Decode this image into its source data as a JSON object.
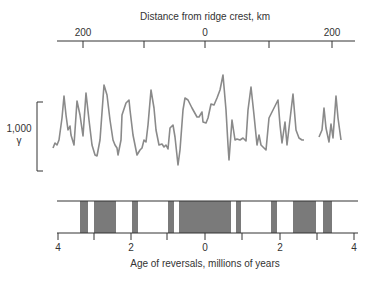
{
  "top_axis": {
    "title": "Distance from ridge crest, km",
    "tick_labels": [
      {
        "label": "200",
        "x": 83
      },
      {
        "label": "0",
        "x": 205
      },
      {
        "label": "200",
        "x": 332
      }
    ],
    "tick_positions": [
      83,
      144,
      205,
      269,
      332
    ]
  },
  "scale": {
    "value": "1,000",
    "unit": "γ"
  },
  "bottom_axis": {
    "title": "Age of reversals, millions of years",
    "tick_labels": [
      {
        "label": "4",
        "x": 58
      },
      {
        "label": "2",
        "x": 131
      },
      {
        "label": "0",
        "x": 205
      },
      {
        "label": "2",
        "x": 280
      },
      {
        "label": "4",
        "x": 354
      }
    ],
    "tick_positions": [
      58,
      94,
      131,
      167,
      205,
      242,
      280,
      317,
      354
    ]
  },
  "colors": {
    "profile": "#8a8a8a",
    "band": "#7a7a7a",
    "axis": "#333333"
  },
  "chart_data": {
    "type": "line",
    "xlabel_top": "Distance from ridge crest, km",
    "xlabel_bottom": "Age of reversals, millions of years",
    "scale_bar": "1,000 γ",
    "profile_segments": [
      [
        [
          53,
          148
        ],
        [
          55,
          143
        ],
        [
          57,
          145
        ],
        [
          59,
          140
        ],
        [
          62,
          118
        ],
        [
          64,
          96
        ],
        [
          66,
          115
        ],
        [
          68,
          130
        ],
        [
          70,
          126
        ],
        [
          71,
          135
        ],
        [
          74,
          145
        ],
        [
          77,
          101
        ],
        [
          80,
          115
        ],
        [
          83,
          136
        ],
        [
          86,
          93
        ],
        [
          89,
          120
        ],
        [
          92,
          145
        ],
        [
          95,
          155
        ],
        [
          97,
          156
        ],
        [
          100,
          140
        ],
        [
          104,
          85
        ],
        [
          107,
          95
        ],
        [
          110,
          120
        ],
        [
          113,
          140
        ],
        [
          115,
          145
        ],
        [
          117,
          148
        ],
        [
          118,
          155
        ],
        [
          121,
          140
        ],
        [
          122,
          115
        ],
        [
          126,
          103
        ],
        [
          129,
          100
        ],
        [
          130,
          110
        ],
        [
          133,
          135
        ],
        [
          137,
          155
        ],
        [
          140,
          150
        ],
        [
          142,
          148
        ],
        [
          144,
          140
        ],
        [
          146,
          142
        ],
        [
          148,
          125
        ],
        [
          151,
          90
        ],
        [
          154,
          108
        ],
        [
          156,
          130
        ],
        [
          159,
          145
        ],
        [
          162,
          144
        ],
        [
          164,
          147
        ],
        [
          166,
          145
        ],
        [
          168,
          149
        ],
        [
          170,
          128
        ],
        [
          173,
          125
        ],
        [
          175,
          137
        ],
        [
          178,
          165
        ],
        [
          180,
          150
        ],
        [
          183,
          110
        ],
        [
          185,
          98
        ],
        [
          188,
          100
        ],
        [
          192,
          108
        ],
        [
          197,
          117
        ],
        [
          199,
          117
        ],
        [
          202,
          112
        ],
        [
          203,
          122
        ],
        [
          206,
          123
        ],
        [
          208,
          118
        ],
        [
          211,
          104
        ],
        [
          214,
          105
        ],
        [
          217,
          98
        ],
        [
          220,
          90
        ],
        [
          223,
          75
        ],
        [
          226,
          110
        ],
        [
          228,
          145
        ],
        [
          229,
          160
        ],
        [
          232,
          120
        ],
        [
          235,
          140
        ],
        [
          237,
          139
        ],
        [
          240,
          140
        ],
        [
          243,
          138
        ],
        [
          246,
          141
        ],
        [
          248,
          110
        ],
        [
          251,
          87
        ],
        [
          254,
          115
        ],
        [
          257,
          145
        ],
        [
          259,
          135
        ],
        [
          261,
          145
        ],
        [
          264,
          148
        ],
        [
          266,
          150
        ],
        [
          269,
          118
        ],
        [
          273,
          110
        ],
        [
          278,
          100
        ],
        [
          280,
          125
        ],
        [
          282,
          143
        ],
        [
          285,
          122
        ],
        [
          287,
          145
        ],
        [
          289,
          128
        ],
        [
          293,
          94
        ],
        [
          296,
          130
        ],
        [
          299,
          138
        ],
        [
          302,
          140
        ],
        [
          304,
          140
        ]
      ],
      [
        [
          319,
          137
        ],
        [
          322,
          130
        ],
        [
          324,
          108
        ],
        [
          326,
          128
        ],
        [
          329,
          142
        ],
        [
          331,
          124
        ],
        [
          333,
          138
        ],
        [
          336,
          96
        ],
        [
          338,
          118
        ],
        [
          341,
          140
        ]
      ]
    ],
    "normal_polarity_bands_px": [
      [
        80,
        88
      ],
      [
        94,
        116
      ],
      [
        132,
        138
      ],
      [
        168,
        174
      ],
      [
        179,
        231
      ],
      [
        236,
        241
      ],
      [
        271,
        277
      ],
      [
        293,
        316
      ],
      [
        323,
        332
      ]
    ],
    "age_ticks_my": [
      4,
      2,
      0,
      2,
      4
    ],
    "distance_ticks_km": [
      200,
      0,
      200
    ]
  }
}
